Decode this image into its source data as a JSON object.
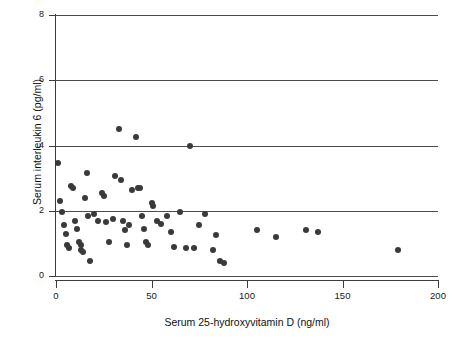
{
  "chart_data": {
    "type": "scatter",
    "title": "",
    "xlabel": "Serum 25-hydroxyvitamin D (ng/ml)",
    "ylabel": "Serum interleukin 6 (pg/ml)",
    "xlim": [
      0,
      200
    ],
    "ylim": [
      0,
      8
    ],
    "xticks": [
      0,
      50,
      100,
      150,
      200
    ],
    "yticks": [
      0,
      2,
      4,
      6,
      8
    ],
    "xticklabels": [
      "0",
      "50",
      "100",
      "150",
      "200"
    ],
    "yticklabels": [
      "0",
      "2",
      "4",
      "6",
      "8"
    ],
    "grid": "horizontal",
    "legend": null,
    "marker": {
      "shape": "circle",
      "color": "#3a3a3a",
      "size": 6
    },
    "series": [
      {
        "name": "subjects",
        "points": [
          [
            1,
            3.45
          ],
          [
            2,
            2.3
          ],
          [
            3,
            1.95
          ],
          [
            4,
            1.55
          ],
          [
            5,
            1.3
          ],
          [
            6,
            0.95
          ],
          [
            7,
            0.85
          ],
          [
            8,
            2.75
          ],
          [
            9,
            2.7
          ],
          [
            10,
            1.7
          ],
          [
            11,
            1.45
          ],
          [
            12,
            1.05
          ],
          [
            13,
            0.95
          ],
          [
            13,
            0.8
          ],
          [
            14,
            0.75
          ],
          [
            15,
            2.4
          ],
          [
            16,
            3.15
          ],
          [
            17,
            1.85
          ],
          [
            18,
            0.45
          ],
          [
            20,
            1.9
          ],
          [
            22,
            1.7
          ],
          [
            24,
            2.55
          ],
          [
            25,
            2.45
          ],
          [
            26,
            1.65
          ],
          [
            28,
            1.05
          ],
          [
            30,
            1.75
          ],
          [
            31,
            3.05
          ],
          [
            33,
            4.5
          ],
          [
            34,
            2.95
          ],
          [
            35,
            1.7
          ],
          [
            36,
            1.4
          ],
          [
            37,
            0.95
          ],
          [
            38,
            1.55
          ],
          [
            40,
            2.65
          ],
          [
            42,
            4.25
          ],
          [
            43,
            2.7
          ],
          [
            44,
            2.7
          ],
          [
            45,
            1.85
          ],
          [
            46,
            1.45
          ],
          [
            47,
            1.05
          ],
          [
            48,
            0.95
          ],
          [
            50,
            2.25
          ],
          [
            51,
            2.15
          ],
          [
            53,
            1.7
          ],
          [
            55,
            1.6
          ],
          [
            58,
            1.85
          ],
          [
            60,
            1.35
          ],
          [
            62,
            0.9
          ],
          [
            65,
            1.95
          ],
          [
            68,
            0.85
          ],
          [
            70,
            4.0
          ],
          [
            72,
            0.85
          ],
          [
            75,
            1.55
          ],
          [
            78,
            1.9
          ],
          [
            82,
            0.8
          ],
          [
            84,
            1.25
          ],
          [
            86,
            0.45
          ],
          [
            88,
            0.4
          ],
          [
            105,
            1.4
          ],
          [
            115,
            1.2
          ],
          [
            131,
            1.4
          ],
          [
            137,
            1.35
          ],
          [
            179,
            0.8
          ]
        ]
      }
    ]
  },
  "axes": {
    "x_title": "Serum 25-hydroxyvitamin D (ng/ml)",
    "y_title": "Serum interleukin 6 (pg/ml)"
  }
}
